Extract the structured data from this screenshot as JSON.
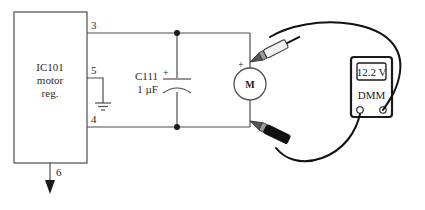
{
  "diagram": {
    "background_color": "#ffffff"
  },
  "ic": {
    "ref": "IC101",
    "line2": "motor",
    "line3": "reg.",
    "pins": [
      {
        "number": "3",
        "side": "right",
        "function": "output-to-motor-positive"
      },
      {
        "number": "5",
        "side": "right",
        "function": "ground"
      },
      {
        "number": "4",
        "side": "right",
        "function": "motor-return"
      },
      {
        "number": "6",
        "side": "bottom",
        "function": "output-arrow"
      }
    ]
  },
  "capacitor": {
    "ref": "C111",
    "value": "1 µF",
    "polarity_marker": "+",
    "type": "polarized"
  },
  "motor": {
    "symbol_label": "M",
    "polarity_marker": "+"
  },
  "meter": {
    "name": "DMM",
    "reading": "12.2 V",
    "jacks": [
      {
        "name": "com-jack",
        "polarity": "black"
      },
      {
        "name": "volts-jack",
        "polarity": "red"
      }
    ]
  },
  "probes": [
    {
      "name": "positive-probe",
      "color": "red",
      "attached_to": "motor-positive-node"
    },
    {
      "name": "negative-probe",
      "color": "black",
      "attached_to": "motor-negative-node"
    }
  ],
  "ground": {
    "symbol": "earth-ground"
  },
  "colors": {
    "wire": "#4d4d4d",
    "lead": "#111111",
    "outline": "#1a1a1a"
  }
}
